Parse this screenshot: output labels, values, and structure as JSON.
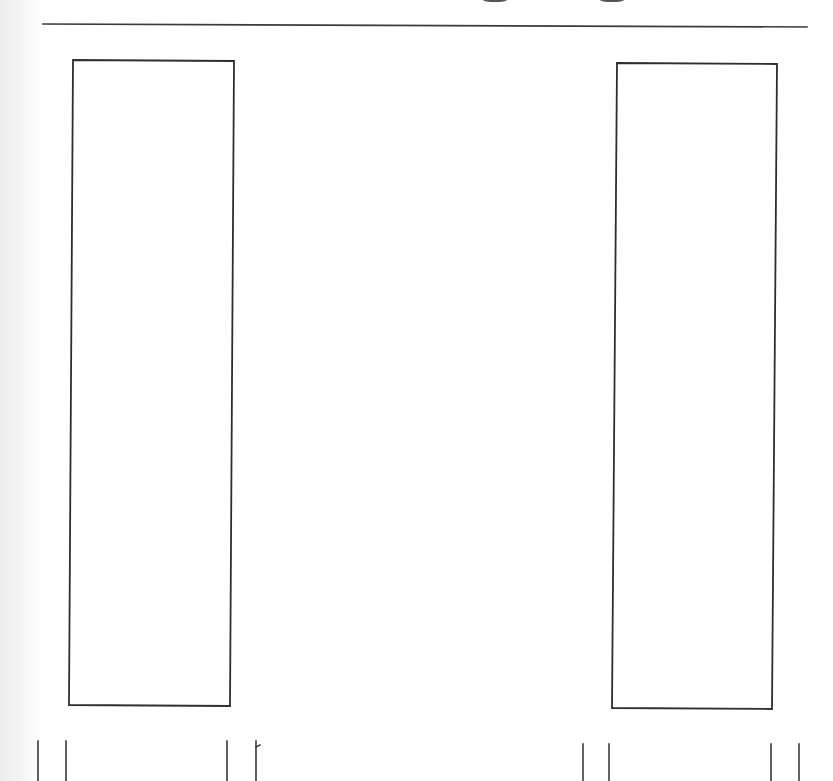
{
  "drawing": {
    "type": "scanned line sketch",
    "background": "#ffffff",
    "stroke_color": "#3a3a3a",
    "top_rule": {
      "x1": 43,
      "y1": 24,
      "x2": 807,
      "y2": 27
    },
    "panels": [
      {
        "name": "left-panel",
        "points": "73,60 234,61 230,706 69,705"
      },
      {
        "name": "right-panel",
        "points": "617,63 777,64 772,709 612,708"
      }
    ],
    "legs": [
      {
        "name": "left-panel-leg-1",
        "x1": 38,
        "y1": 741,
        "x2": 38,
        "y2": 781
      },
      {
        "name": "left-panel-leg-2",
        "x1": 66,
        "y1": 741,
        "x2": 66,
        "y2": 781
      },
      {
        "name": "left-panel-leg-3",
        "x1": 227,
        "y1": 741,
        "x2": 227,
        "y2": 781
      },
      {
        "name": "left-panel-leg-4",
        "x1": 256,
        "y1": 741,
        "x2": 256,
        "y2": 781
      },
      {
        "name": "right-panel-leg-1",
        "x1": 583,
        "y1": 744,
        "x2": 583,
        "y2": 781
      },
      {
        "name": "right-panel-leg-2",
        "x1": 609,
        "y1": 744,
        "x2": 609,
        "y2": 781
      },
      {
        "name": "right-panel-leg-3",
        "x1": 771,
        "y1": 744,
        "x2": 771,
        "y2": 781
      },
      {
        "name": "right-panel-leg-4",
        "x1": 799,
        "y1": 744,
        "x2": 799,
        "y2": 781
      }
    ],
    "tick_mark": {
      "x1": 256,
      "y1": 747,
      "x2": 260,
      "y2": 745
    },
    "cut_off_top_fragments": [
      {
        "cx": 495,
        "cy": 0,
        "rx": 12,
        "ry": 2
      },
      {
        "cx": 612,
        "cy": 0,
        "rx": 12,
        "ry": 2
      }
    ]
  }
}
